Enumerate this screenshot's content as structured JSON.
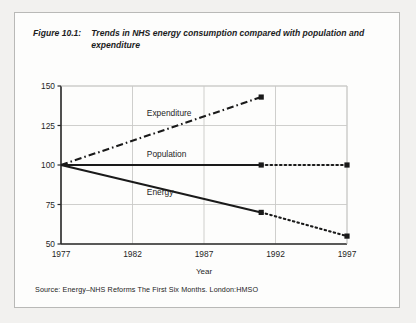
{
  "figure": {
    "number": "Figure 10.1:",
    "caption": "Trends in NHS energy consumption compared with population and expenditure",
    "source": "Source: Energy–NHS Reforms The First Six Months. London:HMSO"
  },
  "chart_data": {
    "type": "line",
    "title": "Trends in NHS energy consumption compared with population and expenditure",
    "xlabel": "Year",
    "ylabel": "",
    "xlim": [
      1977,
      1997
    ],
    "ylim": [
      50,
      150
    ],
    "xticks": [
      "1977",
      "1982",
      "1987",
      "1992",
      "1997"
    ],
    "xtick_values": [
      1977,
      1982,
      1987,
      1992,
      1997
    ],
    "yticks": [
      "50",
      "75",
      "100",
      "125",
      "150"
    ],
    "ytick_values": [
      50,
      75,
      100,
      125,
      150
    ],
    "grid": true,
    "legend": "inline-labels",
    "index_base": 100,
    "series": [
      {
        "name": "Expenditure",
        "style": "dash-dot",
        "label_x": 1983.0,
        "label_y": 133,
        "actual": {
          "x": [
            1977,
            1991
          ],
          "y": [
            100,
            143
          ]
        },
        "projected": {
          "x": [],
          "y": []
        },
        "markers": [
          {
            "x": 1991,
            "y": 143
          }
        ]
      },
      {
        "name": "Population",
        "style": "solid-then-dotted",
        "label_x": 1983.0,
        "label_y": 107,
        "actual": {
          "x": [
            1977,
            1991
          ],
          "y": [
            100,
            100
          ]
        },
        "projected": {
          "x": [
            1991,
            1997
          ],
          "y": [
            100,
            100
          ]
        },
        "markers": [
          {
            "x": 1991,
            "y": 100
          },
          {
            "x": 1997,
            "y": 100
          }
        ]
      },
      {
        "name": "Energy",
        "style": "solid-then-dotted",
        "label_x": 1983.0,
        "label_y": 83,
        "actual": {
          "x": [
            1977,
            1991
          ],
          "y": [
            100,
            70
          ]
        },
        "projected": {
          "x": [
            1991,
            1997
          ],
          "y": [
            70,
            55
          ]
        },
        "markers": [
          {
            "x": 1991,
            "y": 70
          },
          {
            "x": 1997,
            "y": 55
          }
        ]
      }
    ],
    "colors": {
      "line": "#1a1a1a",
      "grid": "#c9c9c7",
      "axis": "#2a2a2a",
      "background": "#fdfdfc"
    }
  }
}
